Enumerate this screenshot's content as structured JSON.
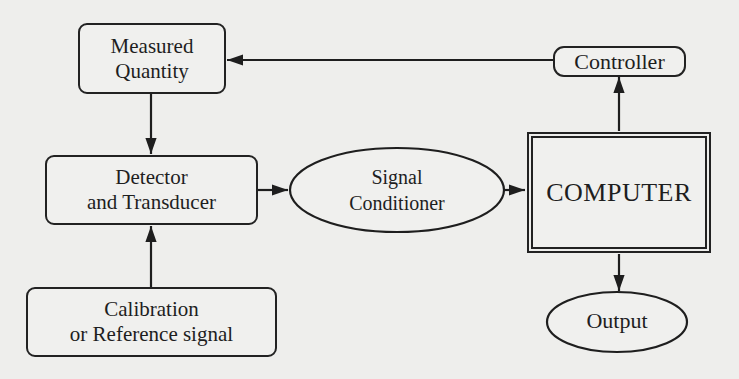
{
  "diagram": {
    "nodes": {
      "measured_quantity": {
        "line1": "Measured",
        "line2": "Quantity"
      },
      "detector": {
        "line1": "Detector",
        "line2": "and Transducer"
      },
      "calibration": {
        "line1": "Calibration",
        "line2": "or Reference signal"
      },
      "signal_conditioner": {
        "line1": "Signal",
        "line2": "Conditioner"
      },
      "computer": {
        "label": "COMPUTER"
      },
      "controller": {
        "label": "Controller"
      },
      "output": {
        "label": "Output"
      }
    },
    "edges": [
      {
        "from": "Measured Quantity",
        "to": "Detector and Transducer"
      },
      {
        "from": "Calibration or Reference signal",
        "to": "Detector and Transducer"
      },
      {
        "from": "Detector and Transducer",
        "to": "Signal Conditioner"
      },
      {
        "from": "Signal Conditioner",
        "to": "COMPUTER"
      },
      {
        "from": "COMPUTER",
        "to": "Controller"
      },
      {
        "from": "COMPUTER",
        "to": "Output"
      },
      {
        "from": "Controller",
        "to": "Measured Quantity"
      }
    ],
    "colors": {
      "ink": "#1e1e1e",
      "paper": "#eeeeec"
    }
  }
}
